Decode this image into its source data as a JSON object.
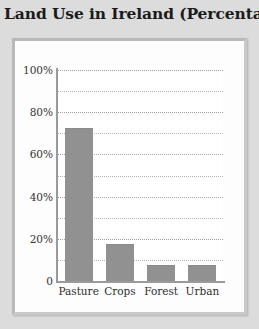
{
  "chart_data": {
    "type": "bar",
    "title": "Land Use in Ireland (Percentage)",
    "xlabel": "",
    "ylabel": "",
    "categories": [
      "Pasture",
      "Crops",
      "Forest",
      "Urban"
    ],
    "values": [
      72,
      17,
      7,
      7
    ],
    "ylim": [
      0,
      100
    ],
    "ytick_values": [
      0,
      10,
      20,
      30,
      40,
      50,
      60,
      70,
      80,
      90,
      100
    ],
    "ytick_labels": [
      "0",
      "",
      "20%",
      "",
      "40%",
      "",
      "60%",
      "",
      "80%",
      "",
      "100%"
    ],
    "gridlines": "horizontal-dotted-every-10-percent",
    "grid": true,
    "legend": "none",
    "bar_color": "#919191",
    "plot_background": "#ffffff",
    "panel_background": "#fdfdfd",
    "page_background": "#dcdcdc",
    "axis_color": "#9a9a9a",
    "grid_color": "#b4b4b4",
    "title_color": "#1b1b1b",
    "tick_label_color": "#333333"
  }
}
